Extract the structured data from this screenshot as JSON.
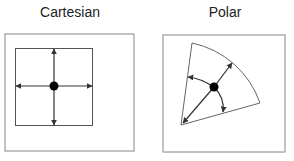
{
  "panels": [
    {
      "title": "Cartesian",
      "type": "cartesian"
    },
    {
      "title": "Polar",
      "type": "polar"
    }
  ],
  "colors": {
    "frame": "#9a9a9a",
    "line": "#444444",
    "dot": "#000000"
  }
}
